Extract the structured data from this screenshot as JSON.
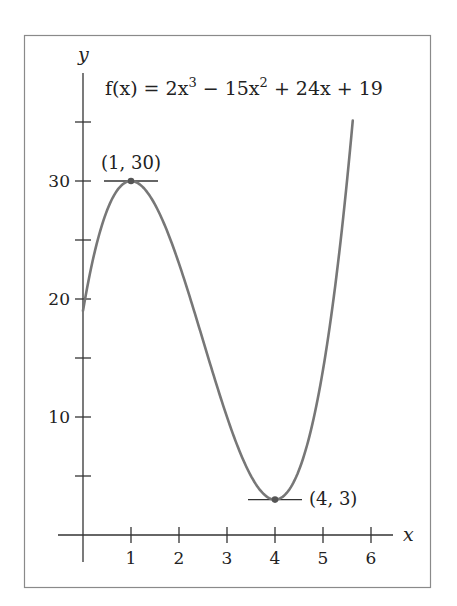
{
  "chart_data": {
    "type": "line",
    "title": "",
    "function_label": {
      "prefix": "f(x) = 2x",
      "exp1": "3",
      "mid": " − 15x",
      "exp2": "2",
      "suffix": " + 24x + 19",
      "full": "f(x) = 2x^3 − 15x^2 + 24x + 19"
    },
    "xlabel": "x",
    "ylabel": "y",
    "xlim": [
      0,
      6
    ],
    "ylim": [
      0,
      36
    ],
    "x_ticks": [
      1,
      2,
      3,
      4,
      5,
      6
    ],
    "x_tick_labels": [
      "1",
      "2",
      "3",
      "4",
      "5",
      "6"
    ],
    "y_ticks": [
      5,
      10,
      15,
      20,
      25,
      30,
      35
    ],
    "y_tick_labels": [
      "",
      "10",
      "",
      "20",
      "",
      "30",
      ""
    ],
    "grid": false,
    "legend": null,
    "series": [
      {
        "name": "f(x) = 2x^3 − 15x^2 + 24x + 19",
        "domain": [
          0,
          5.62
        ],
        "x": [
          0,
          0.25,
          0.5,
          0.75,
          1,
          1.25,
          1.5,
          1.75,
          2,
          2.25,
          2.5,
          2.75,
          3,
          3.25,
          3.5,
          3.75,
          4,
          4.25,
          4.5,
          4.75,
          5,
          5.25,
          5.5,
          5.62
        ],
        "values": [
          19,
          24.09,
          27.5,
          29.41,
          30,
          29.44,
          28,
          25.84,
          23,
          19.84,
          16.5,
          13.16,
          10,
          7.22,
          5,
          3.53,
          3,
          3.59,
          5.5,
          8.91,
          14,
          20.97,
          30,
          34.4
        ]
      }
    ],
    "annotations": [
      {
        "label": "(1, 30)",
        "x": 1,
        "y": 30,
        "type": "local maximum",
        "tangent": true
      },
      {
        "label": "(4, 3)",
        "x": 4,
        "y": 3,
        "type": "local minimum",
        "tangent": true
      }
    ],
    "colors": {
      "curve": "#777777",
      "axes": "#333333",
      "frame": "#8a8a8a",
      "points": "#555555"
    }
  }
}
